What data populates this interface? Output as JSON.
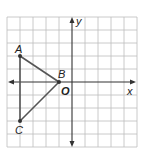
{
  "figure": {
    "type": "coordinate-plane",
    "axes": {
      "x_label": "x",
      "y_label": "y",
      "origin_label": "O"
    },
    "grid": {
      "columns": 10,
      "rows": 10,
      "origin_col": 5,
      "origin_row": 5
    },
    "points": [
      {
        "label": "A",
        "x": -4,
        "y": 2
      },
      {
        "label": "B",
        "x": -1,
        "y": 0
      },
      {
        "label": "C",
        "x": -4,
        "y": -3
      }
    ],
    "segments": [
      [
        "A",
        "B"
      ],
      [
        "B",
        "C"
      ],
      [
        "C",
        "A"
      ]
    ],
    "colors": {
      "grid": "#b8b8b8",
      "axis": "#333333",
      "triangle": "#555555"
    }
  }
}
